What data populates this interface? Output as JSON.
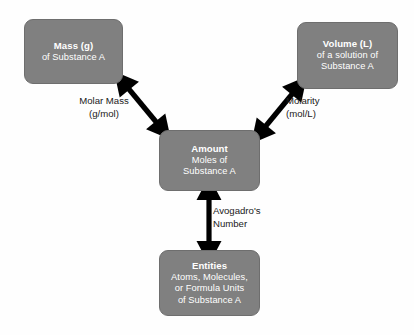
{
  "diagram": {
    "colors": {
      "node_fill": "#808080",
      "node_border": "#6e6e6e",
      "node_text": "#ffffff",
      "arrow": "#000000",
      "label_text": "#1a1a1a",
      "background": "#fefefe"
    },
    "nodes": {
      "mass": {
        "title": "Mass (g)",
        "line2": "of Substance A"
      },
      "volume": {
        "title": "Volume (L)",
        "line2": "of a solution of",
        "line3": "Substance A"
      },
      "amount": {
        "title": "Amount",
        "line2": "Moles of",
        "line3": "Substance A"
      },
      "entities": {
        "title": "Entities",
        "line2": "Atoms, Molecules,",
        "line3": "or Formula Units",
        "line4": "of Substance A"
      }
    },
    "edges": {
      "molar_mass": {
        "line1": "Molar Mass",
        "line2": "(g/mol)",
        "connects": "mass ↔ amount",
        "arrowheads": "double"
      },
      "molarity": {
        "line1": "Molarity",
        "line2": "(mol/L)",
        "connects": "volume ↔ amount",
        "arrowheads": "double"
      },
      "avogadro": {
        "line1": "Avogadro's",
        "line2": "Number",
        "connects": "amount ↔ entities",
        "arrowheads": "double"
      }
    }
  }
}
